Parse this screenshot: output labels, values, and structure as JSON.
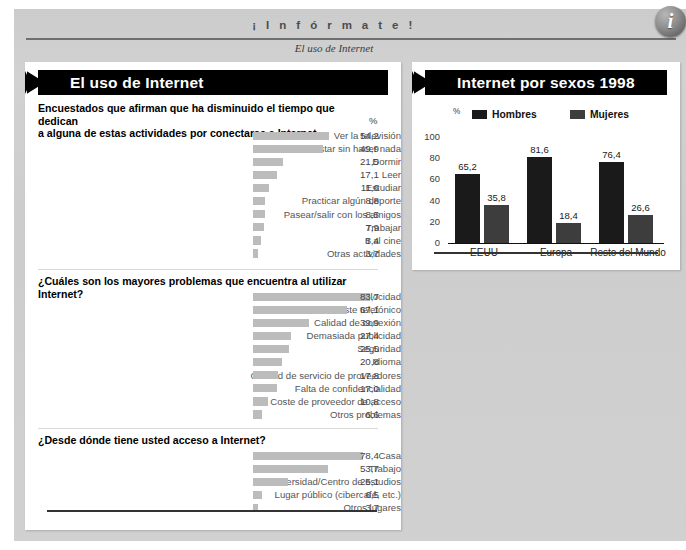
{
  "masthead": {
    "title": "¡ I n f ó r m a t e !",
    "subtitle": "El uso de Internet",
    "badge_letter": "i"
  },
  "left_panel": {
    "title": "El uso de Internet",
    "percent_marker": "%",
    "sections": [
      {
        "heading": "Encuestados que afirman que ha disminuido el tiempo que dedican a alguna de estas actividades por conectarse a Internet",
        "heading_line1": "Encuestados que afirman que ha disminuido el tiempo que dedican",
        "heading_line2": "a alguna de estas actividades por conectarse a Internet",
        "rows": [
          {
            "label": "Ver la televisión",
            "value": "54,2",
            "num": 54.2
          },
          {
            "label": "Estar sin hacer nada",
            "value": "49,9",
            "num": 49.9
          },
          {
            "label": "Dormir",
            "value": "21,5",
            "num": 21.5
          },
          {
            "label": "Leer",
            "value": "17,1",
            "num": 17.1
          },
          {
            "label": "Estudiar",
            "value": "11,6",
            "num": 11.6
          },
          {
            "label": "Practicar algún deporte",
            "value": "8,8",
            "num": 8.8
          },
          {
            "label": "Pasear/salir con los amigos",
            "value": "8,5",
            "num": 8.5
          },
          {
            "label": "Trabajar",
            "value": "7,9",
            "num": 7.9
          },
          {
            "label": "Ir al cine",
            "value": "5,4",
            "num": 5.4
          },
          {
            "label": "Otras actividades",
            "value": "3,7",
            "num": 3.7
          }
        ]
      },
      {
        "heading": "¿Cuáles son los mayores problemas que encuentra al utilizar Internet?",
        "rows": [
          {
            "label": "Velocidad",
            "value": "83,7",
            "num": 83.7
          },
          {
            "label": "Coste telefónico",
            "value": "67,1",
            "num": 67.1
          },
          {
            "label": "Calidad de conexión",
            "value": "39,9",
            "num": 39.9
          },
          {
            "label": "Demasiada publicidad",
            "value": "27,4",
            "num": 27.4
          },
          {
            "label": "Seguridad",
            "value": "25,5",
            "num": 25.5
          },
          {
            "label": "Idioma",
            "value": "20,8",
            "num": 20.8
          },
          {
            "label": "Calidad de servicio de proveedores",
            "value": "17,8",
            "num": 17.8
          },
          {
            "label": "Falta de confidencialidad",
            "value": "17,0",
            "num": 17.0
          },
          {
            "label": "Coste de proveedor de acceso",
            "value": "10,8",
            "num": 10.8
          },
          {
            "label": "Otros problemas",
            "value": "6,6",
            "num": 6.6
          }
        ]
      },
      {
        "heading": "¿Desde dónde tiene usted acceso a Internet?",
        "rows": [
          {
            "label": "Casa",
            "value": "78,4",
            "num": 78.4
          },
          {
            "label": "Trabajo",
            "value": "53,7",
            "num": 53.7
          },
          {
            "label": "Universidad/Centro de estudios",
            "value": "25,1",
            "num": 25.1
          },
          {
            "label": "Lugar público (cibercafé, etc.)",
            "value": "6,5",
            "num": 6.5
          },
          {
            "label": "Otros lugares",
            "value": "3,7",
            "num": 3.7
          }
        ]
      }
    ]
  },
  "right_panel": {
    "title": "Internet por sexos 1998",
    "percent_marker": "%"
  },
  "chart_data": {
    "type": "bar",
    "title": "Internet por sexos 1998",
    "xlabel": "",
    "ylabel": "%",
    "ylim": [
      0,
      100
    ],
    "yticks": [
      "0",
      "20",
      "40",
      "60",
      "80",
      "100"
    ],
    "grid": false,
    "legend_position": "top",
    "categories": [
      "EEUU",
      "Europa",
      "Resto del Mundo"
    ],
    "series": [
      {
        "name": "Hombres",
        "color": "#1a1a1a",
        "values": [
          65.2,
          81.6,
          76.4
        ],
        "labels": [
          "65,2",
          "81,6",
          "76,4"
        ]
      },
      {
        "name": "Mujeres",
        "color": "#3d3d3d",
        "values": [
          35.8,
          18.4,
          26.6
        ],
        "labels": [
          "35,8",
          "18,4",
          "26,6"
        ]
      }
    ]
  },
  "colors": {
    "bar_gray": "#bcbcbc",
    "hombres": "#1a1a1a",
    "mujeres": "#3d3d3d",
    "page_gray": "#cfcfcf"
  }
}
